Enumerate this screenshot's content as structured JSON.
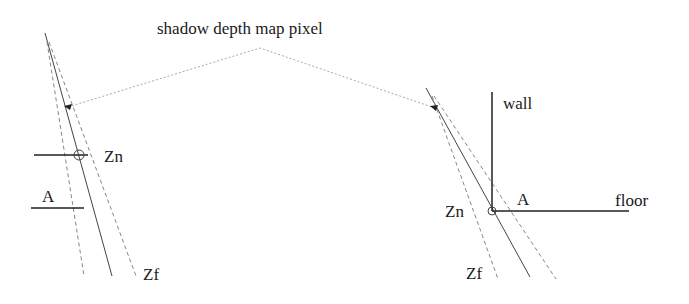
{
  "title": "shadow depth map pixel",
  "left_panel": {
    "labels": {
      "zn": "Zn",
      "zf": "Zf",
      "a": "A"
    }
  },
  "right_panel": {
    "labels": {
      "wall": "wall",
      "floor": "floor",
      "zn": "Zn",
      "zf": "Zf",
      "a": "A"
    }
  },
  "colors": {
    "line": "#333333",
    "dashed": "#888888",
    "dotted": "#aaaaaa",
    "text": "#1a1a1a"
  }
}
